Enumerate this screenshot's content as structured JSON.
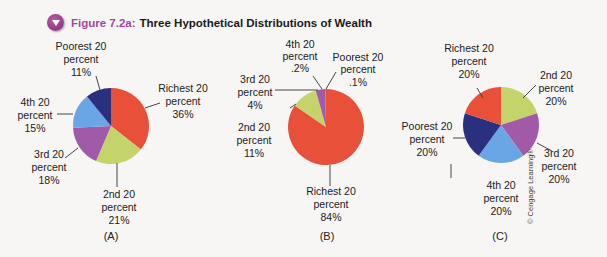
{
  "figure": {
    "number": "Figure 7.2a:",
    "title": "Three Hypothetical Distributions of Wealth",
    "copyright": "© Cengage Learning®"
  },
  "colors": {
    "richest": "#e8503a",
    "second": "#c5d46a",
    "third": "#a05aa8",
    "fourth": "#6aa6e6",
    "poorest": "#2a2f7e"
  },
  "chart_data": [
    {
      "type": "pie",
      "caption": "(A)",
      "title": "Three Hypothetical Distributions of Wealth",
      "categories": [
        "Richest 20 percent",
        "2nd 20 percent",
        "3rd 20 percent",
        "4th 20 percent",
        "Poorest 20 percent"
      ],
      "values": [
        36,
        21,
        18,
        15,
        11
      ],
      "labels": [
        "36%",
        "21%",
        "18%",
        "15%",
        "11%"
      ]
    },
    {
      "type": "pie",
      "caption": "(B)",
      "categories": [
        "Richest 20 percent",
        "2nd 20 percent",
        "3rd 20 percent",
        "4th 20 percent",
        "Poorest 20 percent"
      ],
      "values": [
        84,
        11,
        4,
        0.2,
        0.1
      ],
      "labels": [
        "84%",
        "11%",
        "4%",
        ".2%",
        ".1%"
      ]
    },
    {
      "type": "pie",
      "caption": "(C)",
      "categories": [
        "Richest 20 percent",
        "2nd 20 percent",
        "3rd 20 percent",
        "4th 20 percent",
        "Poorest 20 percent"
      ],
      "values": [
        20,
        20,
        20,
        20,
        20
      ],
      "labels": [
        "20%",
        "20%",
        "20%",
        "20%",
        "20%"
      ]
    }
  ],
  "text": {
    "percent": "percent",
    "richest": "Richest 20",
    "second": "2nd 20",
    "third": "3rd 20",
    "fourth": "4th 20",
    "poorest": "Poorest 20"
  }
}
